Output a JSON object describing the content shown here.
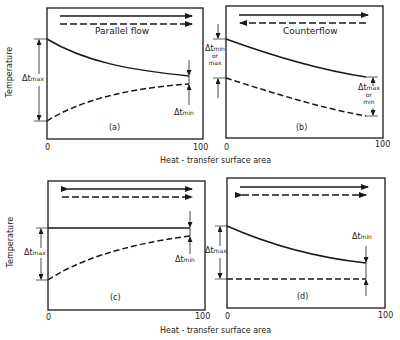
{
  "axis": {
    "ylabel": "Temperature",
    "xlabel": "Heat - transfer surface area",
    "x_start": "0",
    "x_end": "100"
  },
  "panels": {
    "a": {
      "tag": "(a)",
      "title": "Parallel flow",
      "delta_left": {
        "sym": "Δt",
        "sub": "max"
      },
      "delta_right": {
        "sym": "Δt",
        "sub": "min"
      }
    },
    "b": {
      "tag": "(b)",
      "title": "Counterflow",
      "delta_left": {
        "sym": "Δt",
        "sub": "min",
        "line2": "or",
        "line3": "max"
      },
      "delta_right": {
        "sym": "Δt",
        "sub": "max",
        "line2": "or",
        "line3": "min"
      }
    },
    "c": {
      "tag": "(c)",
      "delta_left": {
        "sym": "Δt",
        "sub": "max"
      },
      "delta_right": {
        "sym": "Δt",
        "sub": "min"
      }
    },
    "d": {
      "tag": "(d)",
      "delta_left": {
        "sym": "Δt",
        "sub": "max"
      },
      "delta_right": {
        "sym": "Δt",
        "sub": "min"
      }
    }
  },
  "colors": {
    "line": "#1a1a1a",
    "background": "#ffffff"
  }
}
